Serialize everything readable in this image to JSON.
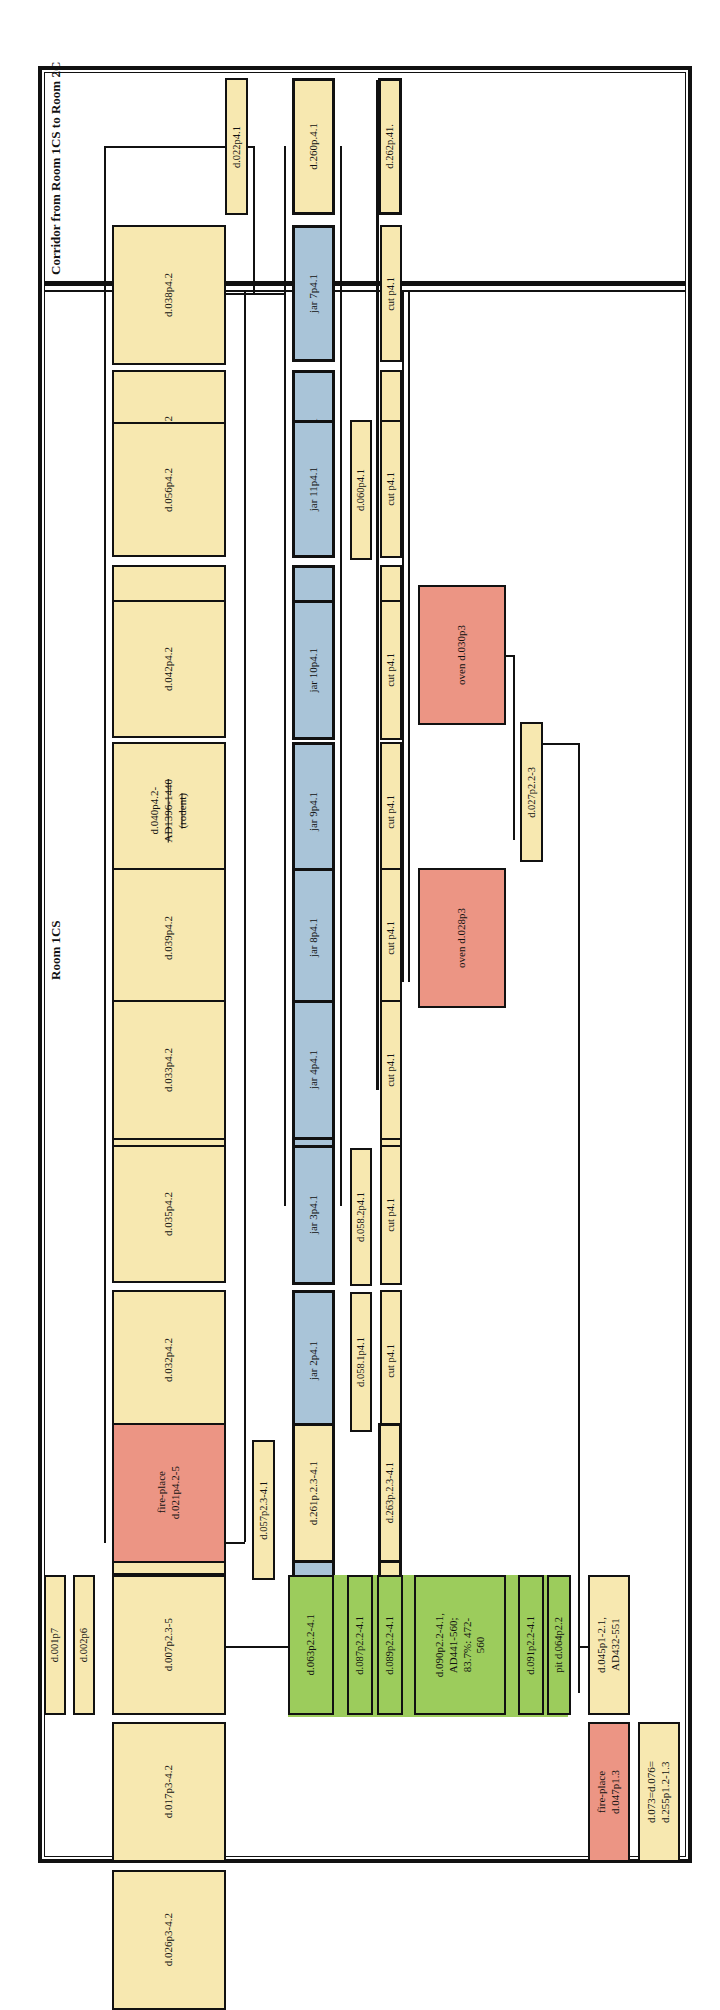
{
  "titles": {
    "corridor": "Corridor from Room 1CS to Room 2C",
    "room": "Room 1CS"
  },
  "colors": {
    "cream": "#f7e8b0",
    "blue": "#a9c4d8",
    "red": "#ec9584",
    "green": "#9ccc5c",
    "line": "#111111"
  },
  "top_column": [
    {
      "id": "d038",
      "label": "d.038p4.2"
    },
    {
      "id": "d043",
      "label": "d.043p4.2"
    },
    {
      "id": "d056",
      "label": "d.056p4.2"
    },
    {
      "id": "d041",
      "label": "d.041p4.2,\nAD443-585;\n90.3%: 476-\n585; 71.9%:\n529-585"
    },
    {
      "id": "d042",
      "label": "d.042p4.2"
    },
    {
      "id": "d040",
      "label_line1": "d.040p4.2-",
      "label_line2": "AD1396-1440",
      "label_line3": "(rodent)"
    },
    {
      "id": "d039",
      "label": "d.039p4.2"
    },
    {
      "id": "d037",
      "label": "d.037p4.2"
    },
    {
      "id": "d033",
      "label": "d.033p4.2"
    },
    {
      "id": "d035",
      "label": "d.035p4.2"
    },
    {
      "id": "d032",
      "label": "d.032p4.2"
    },
    {
      "id": "d015",
      "label": "d.015p4.1-4.2"
    },
    {
      "id": "d021",
      "label": "fire-place\nd.021p4.2-5"
    },
    {
      "id": "d007",
      "label": "d.007p2.3-5"
    },
    {
      "id": "d017",
      "label": "d.017p3-4.2"
    },
    {
      "id": "d026",
      "label": "d.026p3-4.2"
    }
  ],
  "top_labels": {
    "d001": "d.001p7",
    "d002": "d.002p6",
    "d022": "d.022p4.1",
    "d057": "d.057p2.3-4.1"
  },
  "jars": [
    {
      "id": "d260",
      "label": "d.260p.4.1"
    },
    {
      "id": "jar7",
      "label": "jar 7p4.1"
    },
    {
      "id": "jar1",
      "label": "jar 1p4.1"
    },
    {
      "id": "jar11",
      "label": "jar 11p4.1"
    },
    {
      "id": "jar5",
      "label": "jar 5p4.1"
    },
    {
      "id": "jar10",
      "label": "jar 10p4.1"
    },
    {
      "id": "jar9",
      "label": "jar 9p4.1"
    },
    {
      "id": "jar8",
      "label": "jar 8p4.1"
    },
    {
      "id": "jar6",
      "label": "jar 6p4.1"
    },
    {
      "id": "jar4",
      "label": "jar 4p4.1"
    },
    {
      "id": "jar3",
      "label": "jar 3p4.1"
    },
    {
      "id": "jar2",
      "label": "jar 2p4.1"
    },
    {
      "id": "jar12",
      "label": "jar 12p2.3-4.1"
    },
    {
      "id": "d261",
      "label": "d.261p.2.3-4.1"
    }
  ],
  "mid_labels": {
    "d060": "d.060p4.1",
    "d058_2": "d.058.2p4.1",
    "d058_1": "d.058.1p4.1"
  },
  "cuts": [
    {
      "id": "d262",
      "label": "d.262p.41."
    },
    {
      "id": "cut_a",
      "label": "cut p4.1"
    },
    {
      "id": "cut_b",
      "label": "cut p4.1"
    },
    {
      "id": "cut_c",
      "label": "cut p4.1"
    },
    {
      "id": "cut_d",
      "label": "cut p4.1"
    },
    {
      "id": "cut_e",
      "label": "cut p4.1"
    },
    {
      "id": "cut_f",
      "label": "cut p4.1"
    },
    {
      "id": "cut_g",
      "label": "cut p4.1"
    },
    {
      "id": "cut_h",
      "label": "cut p4.1"
    },
    {
      "id": "cut_i",
      "label": "cut p4.1"
    },
    {
      "id": "cut_j",
      "label": "cut p4.1"
    },
    {
      "id": "cut_k",
      "label": "cut p4.1"
    },
    {
      "id": "cut_l",
      "label": "cut p2.3-4.1"
    },
    {
      "id": "d263",
      "label": "d.263p.2.3-4.1"
    }
  ],
  "ovens": {
    "d030": "oven d.030p3",
    "d028": "oven d.028p3",
    "d027": "d.027p2.2-3"
  },
  "green_group": [
    {
      "id": "d063",
      "label": "d.063p2.2-4.1"
    },
    {
      "id": "d087",
      "label": "d.087p2.2-4.1"
    },
    {
      "id": "d089",
      "label": "d.089p2.2-4.1"
    },
    {
      "id": "d090",
      "label": "d.090p2.2-4.1,\nAD441-560;\n83.7%: 472-\n560"
    },
    {
      "id": "d091",
      "label": "d.091p2.2-4.1"
    },
    {
      "id": "d064",
      "label": "pit d.064p2.2"
    }
  ],
  "bottom": {
    "d045": "d.045p1-2.1,\nAD432-551",
    "d047": "fire-place\nd.047p1.3",
    "d073": "d.073=d.076=\nd.255p1.2-1.3"
  }
}
